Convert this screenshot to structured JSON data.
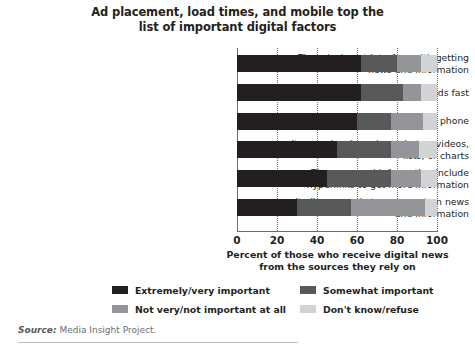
{
  "title": {
    "line1": "Ad placement, load times, and mobile top the",
    "line2": "list of important digital factors"
  },
  "axis_title": {
    "line1": "Percent of those who receive digital news",
    "line2": "from the sources they rely on"
  },
  "source": {
    "label": "Source:",
    "text": " Media Insight Project."
  },
  "legend": {
    "items": [
      {
        "label": "Extremely/very important",
        "color": "#231f20"
      },
      {
        "label": "Somewhat important",
        "color": "#58595b"
      },
      {
        "label": "Not very/not important at all",
        "color": "#939598"
      },
      {
        "label": "Don't know/refuse",
        "color": "#d1d3d4"
      }
    ]
  },
  "chart_data": {
    "type": "bar",
    "orientation": "horizontal",
    "stacked": true,
    "stack_total": 100,
    "title": "Ad placement, load times, and mobile top the list of important digital factors",
    "xlabel": "Percent of those who receive digital news from the sources they rely on",
    "ylabel": "",
    "xlim": [
      0,
      100
    ],
    "xticks": [
      0,
      20,
      40,
      60,
      80,
      100
    ],
    "xtick_labels": [
      "0",
      "20",
      "40",
      "60",
      "80",
      "100"
    ],
    "grid": "vertical-dotted",
    "legend_position": "bottom",
    "categories": [
      "The ads do not interfere with getting news and information",
      "The site or app loads fast",
      "It works well on my mobile phone",
      "It uses visuals such as photos, videos, lists, or charts",
      "The news and information include hyperlinks to get more information",
      "It allows people to comment on news and information"
    ],
    "category_lines": [
      [
        "The ads do not interfere with getting",
        "news and information"
      ],
      [
        "The site or app loads fast"
      ],
      [
        "It works well on my mobile phone"
      ],
      [
        "It uses visuals such as photos, videos,",
        "lists, or charts"
      ],
      [
        "The news and information include",
        "hyperlinks to get more information"
      ],
      [
        "It allows people to comment on news",
        "and information"
      ]
    ],
    "series": [
      {
        "name": "Extremely/very important",
        "color": "#231f20",
        "values": [
          62,
          62,
          60,
          50,
          45,
          30
        ]
      },
      {
        "name": "Somewhat important",
        "color": "#58595b",
        "values": [
          18,
          21,
          17,
          27,
          32,
          27
        ]
      },
      {
        "name": "Not very/not important at all",
        "color": "#939598",
        "values": [
          12,
          9,
          16,
          14,
          15,
          37
        ]
      },
      {
        "name": "Don't know/refuse",
        "color": "#d1d3d4",
        "values": [
          8,
          8,
          7,
          9,
          8,
          6
        ]
      }
    ]
  }
}
